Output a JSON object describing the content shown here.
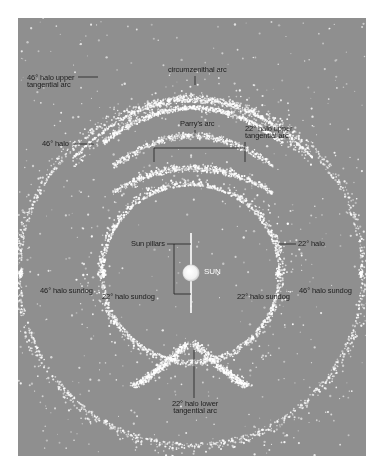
{
  "diagram": {
    "type": "atmospheric halo phenomena",
    "background_color": "#8f8f8f",
    "particle_color": "#ffffff",
    "leader_line_color": "#1e1e1e",
    "labels": {
      "circumzenithal_arc": "circumzenithal arc",
      "halo46_upper_tangential_line1": "46° halo upper",
      "halo46_upper_tangential_line2": "tangential arc",
      "parrys_arc": "Parry's arc",
      "halo22_upper_tangential_line1": "22° halo upper",
      "halo22_upper_tangential_line2": "tangential arc",
      "halo46": "46° halo",
      "sun_pillars": "Sun pillars",
      "sun": "SUN",
      "halo22": "22° halo",
      "halo46_sundog_left": "46° halo sundog",
      "halo22_sundog_left": "22° halo sundog",
      "halo22_sundog_right": "22° halo sundog",
      "halo46_sundog_right": "46° halo sundog",
      "halo22_lower_tangential_line1": "22° halo lower",
      "halo22_lower_tangential_line2": "tangential arc"
    }
  }
}
